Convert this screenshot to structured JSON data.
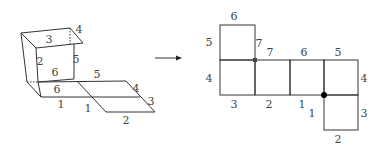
{
  "figure": {
    "left_3d_labels": [
      {
        "text": "3",
        "x": 49,
        "y": 43
      },
      {
        "text": "4",
        "x": 79,
        "y": 33
      },
      {
        "text": "2",
        "x": 40,
        "y": 65
      },
      {
        "text": "6",
        "x": 55,
        "y": 76
      },
      {
        "text": "5",
        "x": 76,
        "y": 63
      },
      {
        "text": "5",
        "x": 97,
        "y": 78
      },
      {
        "text": "6",
        "x": 57,
        "y": 93
      },
      {
        "text": "4",
        "x": 136,
        "y": 92
      },
      {
        "text": "1",
        "x": 61,
        "y": 108
      },
      {
        "text": "1",
        "x": 88,
        "y": 112
      },
      {
        "text": "3",
        "x": 151,
        "y": 105
      },
      {
        "text": "2",
        "x": 126,
        "y": 124
      }
    ],
    "right_net_labels": [
      {
        "text": "6",
        "x": 234,
        "y": 20
      },
      {
        "text": "5",
        "x": 209,
        "y": 46
      },
      {
        "text": "7",
        "x": 259,
        "y": 47
      },
      {
        "text": "7",
        "x": 270,
        "y": 56
      },
      {
        "text": "6",
        "x": 304,
        "y": 56
      },
      {
        "text": "5",
        "x": 338,
        "y": 56
      },
      {
        "text": "4",
        "x": 209,
        "y": 82
      },
      {
        "text": "4",
        "x": 364,
        "y": 82
      },
      {
        "text": "3",
        "x": 234,
        "y": 108
      },
      {
        "text": "2",
        "x": 269,
        "y": 108
      },
      {
        "text": "1",
        "x": 302,
        "y": 108
      },
      {
        "text": "1",
        "x": 312,
        "y": 117
      },
      {
        "text": "3",
        "x": 364,
        "y": 117
      },
      {
        "text": "2",
        "x": 338,
        "y": 143
      }
    ],
    "arrow": {
      "label": "",
      "direction": "right"
    }
  }
}
